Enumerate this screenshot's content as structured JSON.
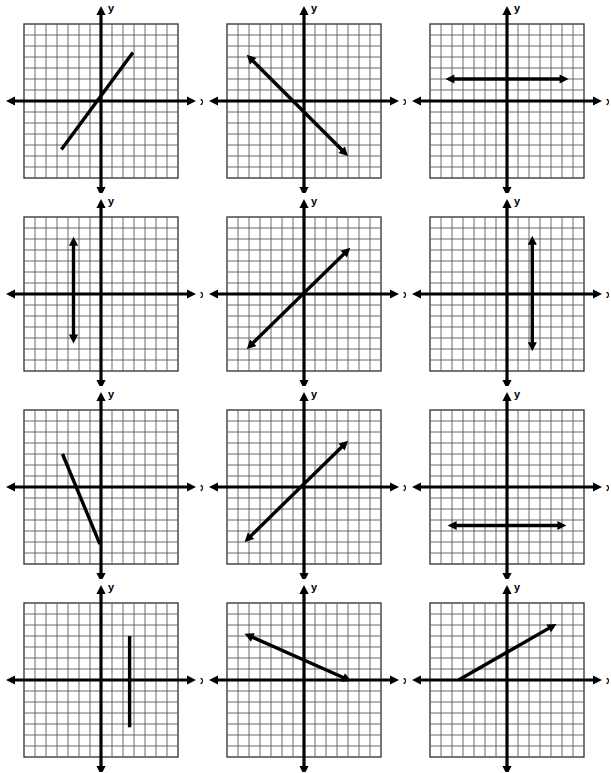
{
  "page": {
    "background_color": "#ffffff",
    "width": 611,
    "height": 773,
    "columns": 3,
    "rows": 4
  },
  "style": {
    "grid_line_color": "#5a5a5a",
    "grid_border_color": "#3c3c3c",
    "axis_color": "#000000",
    "line_color": "#000000",
    "label_color": "#000000",
    "axis_stroke_width": 3.2,
    "plot_stroke_width": 3.4,
    "grid_stroke_width": 0.9
  },
  "grid": {
    "cells_across": 14,
    "cells_down": 14,
    "cell_size_px": 11,
    "x_min": -7,
    "x_max": 7,
    "y_min": -7,
    "y_max": 7
  },
  "axes": {
    "x_label": "x",
    "y_label": "y",
    "x_axis_name": "x-axis",
    "y_axis_name": "y-axis",
    "arrowheads": "both-ends"
  },
  "chart_data": {
    "type": "line",
    "xlabel": "x",
    "ylabel": "y",
    "xlim": [
      -7,
      7
    ],
    "ylim": [
      -7,
      7
    ],
    "grid": true,
    "legend": "none",
    "panel_layout": {
      "rows": 4,
      "cols": 3,
      "total": 12
    },
    "panels": [
      {
        "index": 1,
        "position": {
          "row": 1,
          "col": 1
        },
        "kind": "segment",
        "arrowheads": "none",
        "slope": 1.35,
        "intercept": 0.3,
        "x1": -3.6,
        "y1": -4.4,
        "x2": 2.9,
        "y2": 4.4,
        "description": "Positive slope segment through near origin, no arrowheads"
      },
      {
        "index": 2,
        "position": {
          "row": 1,
          "col": 2
        },
        "kind": "line",
        "arrowheads": "both",
        "slope": -1.0,
        "intercept": -1.0,
        "x1": -5.2,
        "y1": 4.2,
        "x2": 4.0,
        "y2": -5.0,
        "description": "Negative slope line, arrowheads at both ends"
      },
      {
        "index": 3,
        "position": {
          "row": 1,
          "col": 3
        },
        "kind": "horizontal",
        "arrowheads": "both",
        "slope": 0,
        "intercept": 2.0,
        "x1": -5.6,
        "y1": 2.0,
        "x2": 5.6,
        "y2": 2.0,
        "description": "Horizontal line y = 2 above the x-axis"
      },
      {
        "index": 4,
        "position": {
          "row": 2,
          "col": 1
        },
        "kind": "vertical",
        "arrowheads": "both",
        "slope": null,
        "intercept": null,
        "x1": -2.5,
        "y1": 5.2,
        "x2": -2.5,
        "y2": -4.5,
        "description": "Vertical line x = -2.5 left of the y-axis"
      },
      {
        "index": 5,
        "position": {
          "row": 2,
          "col": 2
        },
        "kind": "line",
        "arrowheads": "both",
        "slope": 1.0,
        "intercept": 0,
        "x1": -5.2,
        "y1": -5.0,
        "x2": 4.2,
        "y2": 4.2,
        "description": "Positive slope line through the origin, slope 1"
      },
      {
        "index": 6,
        "position": {
          "row": 2,
          "col": 3
        },
        "kind": "vertical",
        "arrowheads": "both",
        "slope": null,
        "intercept": null,
        "x1": 2.3,
        "y1": 5.3,
        "x2": 2.3,
        "y2": -5.2,
        "description": "Vertical line x = 2.3 right of the y-axis"
      },
      {
        "index": 7,
        "position": {
          "row": 3,
          "col": 1
        },
        "kind": "segment",
        "arrowheads": "none",
        "slope": -2.6,
        "intercept": -2.0,
        "x1": -3.5,
        "y1": 3.0,
        "x2": -0.1,
        "y2": -5.2,
        "description": "Steep negative slope segment, no arrowheads"
      },
      {
        "index": 8,
        "position": {
          "row": 3,
          "col": 2
        },
        "kind": "line",
        "arrowheads": "both",
        "slope": 1.0,
        "intercept": 0,
        "x1": -5.4,
        "y1": -5.0,
        "x2": 4.0,
        "y2": 4.2,
        "description": "Positive slope line through the origin"
      },
      {
        "index": 9,
        "position": {
          "row": 3,
          "col": 3
        },
        "kind": "horizontal",
        "arrowheads": "both",
        "slope": 0,
        "intercept": -3.5,
        "x1": -5.4,
        "y1": -3.5,
        "x2": 5.4,
        "y2": -3.5,
        "description": "Horizontal line y = -3.5 below the x-axis"
      },
      {
        "index": 10,
        "position": {
          "row": 4,
          "col": 1
        },
        "kind": "vertical",
        "arrowheads": "none",
        "slope": null,
        "intercept": null,
        "x1": 2.6,
        "y1": 4.0,
        "x2": 2.6,
        "y2": -4.3,
        "description": "Vertical segment x = 2.6, no arrowheads"
      },
      {
        "index": 11,
        "position": {
          "row": 4,
          "col": 2
        },
        "kind": "line",
        "arrowheads": "both",
        "slope": -0.55,
        "intercept": -0.6,
        "x1": -5.4,
        "y1": 4.2,
        "x2": 4.3,
        "y2": -0.1,
        "description": "Shallow negative slope line crossing the x-axis at right"
      },
      {
        "index": 12,
        "position": {
          "row": 4,
          "col": 3
        },
        "kind": "segment",
        "arrowheads": "end",
        "slope": 0.6,
        "intercept": 2.6,
        "x1": -4.4,
        "y1": 0.0,
        "x2": 4.5,
        "y2": 5.1,
        "description": "Positive shallow slope from x-axis up to upper right, arrowhead at end"
      }
    ]
  }
}
